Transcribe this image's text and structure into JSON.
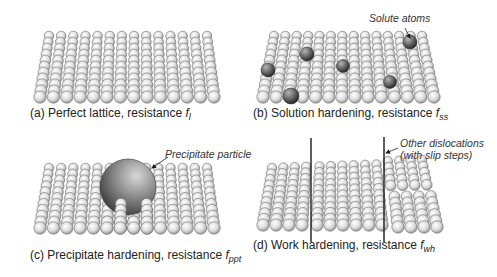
{
  "figure": {
    "panels": [
      {
        "id": "a",
        "caption_prefix": "(a) Perfect lattice, resistance ",
        "symbol": "f",
        "subscript": "l",
        "lattice": {
          "cols": 14,
          "rows": 11,
          "top_left": [
            49,
            36
          ],
          "top_right": [
            207,
            36
          ],
          "bottom_left": [
            40,
            97
          ],
          "bottom_right": [
            214,
            97
          ],
          "r_top": 4.8,
          "r_bottom": 6.2
        },
        "caption_pos": [
          30,
          106
        ]
      },
      {
        "id": "b",
        "caption_prefix": "(b) Solution hardening, resistance ",
        "symbol": "f",
        "subscript": "ss",
        "lattice": {
          "cols": 14,
          "rows": 11,
          "top_left": [
            274,
            36
          ],
          "top_right": [
            422,
            36
          ],
          "bottom_left": [
            263,
            97
          ],
          "bottom_right": [
            434,
            97
          ],
          "r_top": 4.8,
          "r_bottom": 6.2
        },
        "solutes": [
          [
            268,
            70,
            7
          ],
          [
            307,
            54,
            7
          ],
          [
            343,
            66,
            6.5
          ],
          [
            410,
            42,
            7
          ],
          [
            390,
            82,
            6.5
          ],
          [
            291,
            96,
            8
          ]
        ],
        "annotation": {
          "text": "Solute atoms",
          "pos": [
            369,
            12
          ],
          "arrow": [
            [
              405,
              28
            ],
            [
              410,
              38
            ]
          ]
        },
        "caption_pos": [
          253,
          106
        ]
      },
      {
        "id": "c",
        "caption_prefix": "(c) Precipitate hardening, resistance ",
        "symbol": "f",
        "subscript": "ppt",
        "lattice": {
          "cols": 14,
          "rows": 11,
          "top_left": [
            49,
            168
          ],
          "top_right": [
            207,
            168
          ],
          "bottom_left": [
            40,
            228
          ],
          "bottom_right": [
            214,
            228
          ],
          "r_top": 4.8,
          "r_bottom": 6.2
        },
        "precipitate": {
          "cx": 128,
          "cy": 187,
          "r": 28
        },
        "annotation": {
          "text": "Precipitate particle",
          "pos": [
            165,
            148
          ],
          "arrow": [
            [
              168,
              157
            ],
            [
              152,
              168
            ]
          ]
        },
        "caption_pos": [
          30,
          248
        ]
      },
      {
        "id": "d",
        "caption_prefix": "(d) Work hardening, resistance ",
        "symbol": "f",
        "subscript": "wh",
        "lattice": {
          "cols": 14,
          "rows": 11,
          "top_left": [
            274,
            168
          ],
          "top_right": [
            422,
            163
          ],
          "bottom_left": [
            265,
            225
          ],
          "bottom_right": [
            434,
            225
          ],
          "r_top": 4.8,
          "r_bottom": 6.2
        },
        "dislocations": [
          {
            "x": 311,
            "y1": 138,
            "y2": 242
          },
          {
            "x": 384,
            "y1": 137,
            "y2": 242
          }
        ],
        "annotation": {
          "text1": "Other dislocations",
          "text2": "(with slip steps)",
          "pos": [
            400,
            137
          ],
          "arrow": [
            [
              398,
              148
            ],
            [
              386,
              153
            ]
          ]
        },
        "caption_pos": [
          253,
          238
        ]
      }
    ],
    "colors": {
      "atom_light": "#ffffff",
      "atom_mid": "#d9d9d9",
      "atom_dark": "#8a8a8a",
      "atom_stroke": "#6e6e6e",
      "solute_light": "#a9a9a9",
      "solute_dark": "#2e2e2e",
      "line": "#1a1a1a"
    }
  }
}
